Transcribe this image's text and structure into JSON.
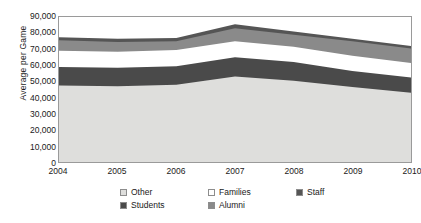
{
  "chart_data": {
    "type": "area",
    "title": "",
    "subtitle": "",
    "xlabel": "",
    "ylabel": "Average per Game",
    "categories": [
      "2004",
      "2005",
      "2006",
      "2007",
      "2008",
      "2009",
      "2010"
    ],
    "x": [
      2004,
      2005,
      2006,
      2007,
      2008,
      2009,
      2010
    ],
    "ylim": [
      0,
      90000
    ],
    "ytick_labels": [
      "0",
      "10,000",
      "20,000",
      "30,000",
      "40,000",
      "50,000",
      "60,000",
      "70,000",
      "80,000",
      "90,000"
    ],
    "ytick_values": [
      0,
      10000,
      20000,
      30000,
      40000,
      50000,
      60000,
      70000,
      80000,
      90000
    ],
    "stacked": true,
    "grid": false,
    "legend_position": "bottom",
    "series": [
      {
        "name": "Other",
        "color": "#dededc",
        "values": [
          47500,
          47000,
          48000,
          53000,
          50500,
          46500,
          43000
        ]
      },
      {
        "name": "Students",
        "color": "#4a4a4a",
        "values": [
          11500,
          11500,
          11500,
          12000,
          11500,
          10000,
          9500
        ]
      },
      {
        "name": "Families",
        "color": "#ffffff",
        "values": [
          10000,
          10000,
          10000,
          10000,
          9500,
          9500,
          9000
        ]
      },
      {
        "name": "Alumni",
        "color": "#8a8a8a",
        "values": [
          6500,
          6000,
          5500,
          8000,
          7500,
          9000,
          9000
        ]
      },
      {
        "name": "Staff",
        "color": "#555555",
        "values": [
          2000,
          2000,
          2000,
          2500,
          2000,
          1500,
          1500
        ]
      }
    ],
    "cumulative_tops": {
      "Other": [
        47500,
        47000,
        48000,
        53000,
        50500,
        46500,
        43000
      ],
      "Students": [
        59000,
        58500,
        59500,
        65000,
        62000,
        56500,
        52500
      ],
      "Families": [
        69000,
        68500,
        69500,
        75000,
        71500,
        66000,
        61500
      ],
      "Alumni": [
        75500,
        74500,
        75000,
        83000,
        79000,
        75000,
        70500
      ],
      "Staff": [
        77500,
        76500,
        77000,
        85500,
        81000,
        76500,
        72000
      ]
    }
  },
  "legend": {
    "items": [
      {
        "label": "Other",
        "swatch": "#dededc"
      },
      {
        "label": "Families",
        "swatch": "#ffffff"
      },
      {
        "label": "Staff",
        "swatch": "#555555"
      },
      {
        "label": "Students",
        "swatch": "#4a4a4a"
      },
      {
        "label": "Alumni",
        "swatch": "#8a8a8a"
      }
    ]
  }
}
